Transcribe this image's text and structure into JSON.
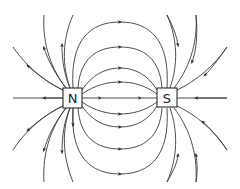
{
  "diagram": {
    "type": "magnetic-field-lines",
    "poles": [
      {
        "label": "N",
        "name": "north-pole",
        "center": [
          73,
          98
        ]
      },
      {
        "label": "S",
        "name": "south-pole",
        "center": [
          167,
          98
        ]
      }
    ],
    "field_direction": "from N to S",
    "colors": {
      "line": "#3a3a3a",
      "box_stroke": "#2a2a2a",
      "background": "#ffffff"
    }
  }
}
